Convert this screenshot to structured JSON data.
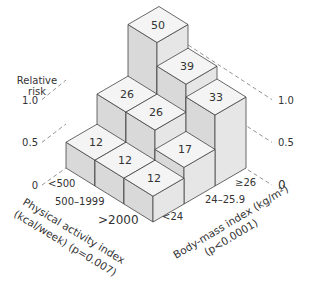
{
  "chart_data": {
    "type": "bar3d",
    "title": "",
    "zlabel": "Relative risk",
    "z_ticks": [
      "0",
      "0.5",
      "1.0"
    ],
    "zlim": [
      0,
      1.0
    ],
    "x_axis": {
      "label_line1": "Physical activity index",
      "label_line2": "(kcal/week) (p=0.007)",
      "categories": [
        "<500",
        "500–1999",
        ">2000"
      ]
    },
    "y_axis": {
      "label_line1": "Body-mass index (kg/m²)",
      "label_line2": "(p<0.0001)",
      "categories": [
        "<24",
        "24–25.9",
        "≥26"
      ]
    },
    "series": [
      {
        "name": "<500",
        "values": [
          12,
          26,
          50
        ]
      },
      {
        "name": "500–1999",
        "values": [
          12,
          26,
          39
        ]
      },
      {
        "name": ">2000",
        "values": [
          12,
          17,
          33
        ]
      }
    ]
  },
  "colors": {
    "top": "#f4f4f4",
    "left": "#d9d9d9",
    "right": "#e6e6e6",
    "edge": "#444444",
    "dash": "#777777",
    "text": "#333333"
  }
}
